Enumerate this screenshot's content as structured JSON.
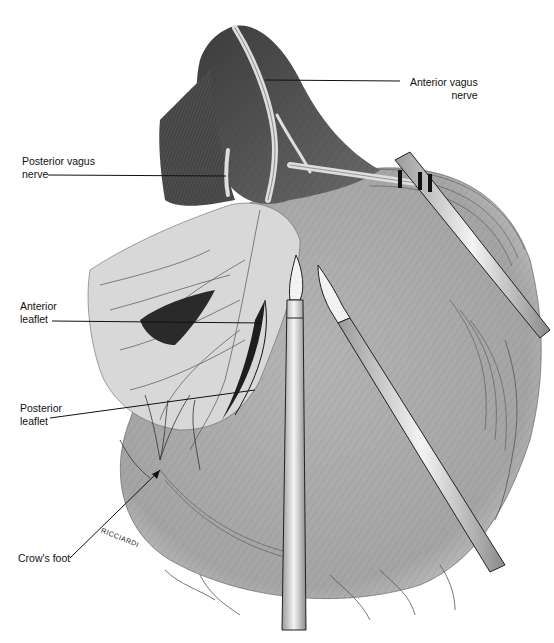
{
  "figure": {
    "colors": {
      "background": "#ffffff",
      "stomach_fill": "#a9a9a9",
      "omentum_fill": "#d6d6d6",
      "esophagus_fill": "#5a5a5a",
      "nerve_fill": "#e8e8e8",
      "instrument_fill": "#efefef",
      "line": "#1a1a1a"
    }
  },
  "labels": {
    "anterior_vagus": {
      "line1": "Anterior vagus",
      "line2": "nerve"
    },
    "posterior_vagus": {
      "line1": "Posterior vagus",
      "line2": "nerve"
    },
    "anterior_leaflet": {
      "line1": "Anterior",
      "line2": "leaflet"
    },
    "posterior_leaflet": {
      "line1": "Posterior",
      "line2": "leaflet"
    },
    "crows_foot": {
      "line1": "Crow's foot"
    }
  },
  "signature": "RICCIARDI"
}
